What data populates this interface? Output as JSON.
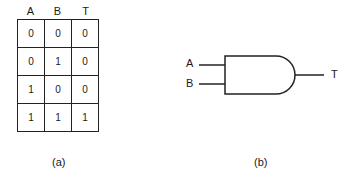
{
  "truth_table": {
    "headers": [
      "A",
      "B",
      "T"
    ],
    "rows": [
      [
        "0",
        "0",
        "0"
      ],
      [
        "0",
        "1",
        "0"
      ],
      [
        "1",
        "0",
        "0"
      ],
      [
        "1",
        "1",
        "1"
      ]
    ],
    "caption": "(a)"
  },
  "gate": {
    "type": "AND",
    "inputs": [
      "A",
      "B"
    ],
    "output": "T",
    "caption": "(b)"
  }
}
